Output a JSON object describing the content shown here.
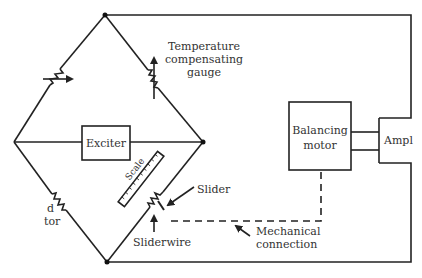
{
  "diagram": {
    "labels": {
      "temperature_gauge_line1": "Temperature",
      "temperature_gauge_line2": "compensating",
      "temperature_gauge_line3": "gauge",
      "exciter": "Exciter",
      "balancing_motor_line1": "Balancing",
      "balancing_motor_line2": "motor",
      "amplifier": "Ampl",
      "slider": "Slider",
      "sliderwire": "Sliderwire",
      "scale": "Scale",
      "mechanical_line1": "Mechanical",
      "mechanical_line2": "connection",
      "gauge_partial_line1": "d",
      "gauge_partial_line2": "tor"
    },
    "components": [
      {
        "name": "variable-resistor",
        "arm": "top-left"
      },
      {
        "name": "temperature-compensating-gauge",
        "arm": "top-right"
      },
      {
        "name": "resistor",
        "arm": "bottom-left"
      },
      {
        "name": "sliderwire",
        "arm": "bottom-right"
      },
      {
        "name": "exciter",
        "position": "center"
      },
      {
        "name": "balancing-motor"
      },
      {
        "name": "amplifier"
      }
    ],
    "colors": {
      "line": "#222222",
      "text": "#333333",
      "background": "#ffffff"
    }
  }
}
